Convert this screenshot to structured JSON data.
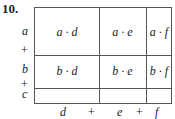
{
  "problem_number": "10.",
  "row_labels": {
    "a": "a",
    "plus1": "+",
    "b": "b",
    "plus2": "+",
    "c": "c"
  },
  "col_labels": {
    "d": "d",
    "plus1": "+",
    "e": "e",
    "plus2": "+",
    "f": "f"
  },
  "cells": {
    "ad": "a · d",
    "ae": "a · e",
    "af": "a · f",
    "bd": "b · d",
    "be": "b · e",
    "bf": "b · f",
    "cd": "",
    "ce": "",
    "cf": ""
  }
}
